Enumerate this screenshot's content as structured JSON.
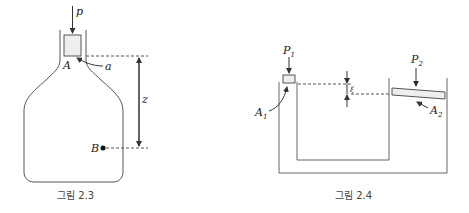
{
  "figures": [
    {
      "id": "fig-2-3",
      "caption": "그림 2.3",
      "labels": {
        "pressure": "p",
        "piston_area": "A",
        "annotation": "a",
        "height": "z",
        "point": "B"
      }
    },
    {
      "id": "fig-2-4",
      "caption": "그림 2.4",
      "labels": {
        "p1": "P",
        "p1_sub": "1",
        "p2": "P",
        "p2_sub": "2",
        "a1": "A",
        "a1_sub": "1",
        "a2": "A",
        "a2_sub": "2",
        "offset": "ξ"
      }
    }
  ],
  "colors": {
    "stroke": "#555555",
    "piston_fill": "#eeeeee",
    "text": "#222222"
  }
}
